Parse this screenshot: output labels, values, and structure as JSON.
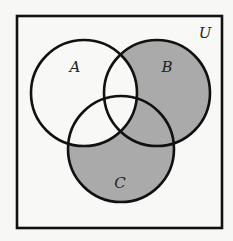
{
  "diagram": {
    "type": "venn",
    "universe": {
      "label": "U",
      "box": {
        "x": 17,
        "y": 16,
        "width": 205,
        "height": 212
      },
      "label_pos": {
        "x": 205,
        "y": 38
      }
    },
    "sets": [
      {
        "id": "A",
        "label": "A",
        "cx": 84,
        "cy": 93,
        "r": 53,
        "label_pos": {
          "x": 75,
          "y": 72
        }
      },
      {
        "id": "B",
        "label": "B",
        "cx": 157,
        "cy": 93,
        "r": 53,
        "label_pos": {
          "x": 167,
          "y": 72
        }
      },
      {
        "id": "C",
        "label": "C",
        "cx": 121,
        "cy": 149,
        "r": 53,
        "label_pos": {
          "x": 120,
          "y": 188
        }
      }
    ],
    "shaded_regions": [
      "B only",
      "C only",
      "B ∩ C ∩ A'"
    ],
    "shaded_expression": "(B ∪ C) ∩ A'",
    "colors": {
      "background": "#f7f7f5",
      "box_fill": "#f8f8f6",
      "shade": "#aaaaaa",
      "stroke": "#111111"
    },
    "stroke_width": 2.6
  }
}
